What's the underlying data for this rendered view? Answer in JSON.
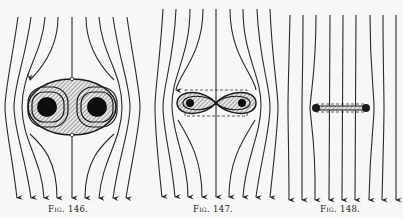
{
  "figures": [
    {
      "id": "fig146",
      "caption": "Fig. 146.",
      "description": "Field lines bending around an elliptical hatched region containing two solid circles (conductor cross-sections) with closed loops circulating around each",
      "field_line_count": 9,
      "direction": "downward"
    },
    {
      "id": "fig147",
      "caption": "Fig. 147.",
      "description": "Field lines bending around a narrower figure-eight hatched region with two small solid circles, bounded by a dashed rectangle",
      "field_line_count": 9,
      "direction": "downward"
    },
    {
      "id": "fig148",
      "caption": "Fig. 148.",
      "description": "Nearly straight field lines around a thin flat bar with small ends, bounded by dashed lines",
      "field_line_count": 9,
      "direction": "downward"
    }
  ],
  "colors": {
    "background": "#f7f7f5",
    "ink": "#2a2a2a"
  }
}
